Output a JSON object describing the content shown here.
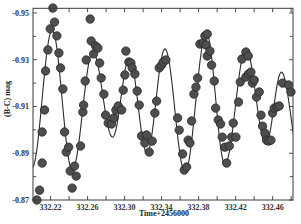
{
  "chart_data": {
    "type": "scatter",
    "title": "",
    "xlabel": "Time+2456000",
    "ylabel": "(B-C) mag",
    "xlim": [
      332.201,
      332.482
    ],
    "ylim": [
      -0.952,
      -0.87
    ],
    "y_inverted": true,
    "grid": false,
    "legend": null,
    "x_ticks": [
      {
        "value": 332.22,
        "label": "332.22"
      },
      {
        "value": 332.26,
        "label": "332.26"
      },
      {
        "value": 332.3,
        "label": "332.30"
      },
      {
        "value": 332.34,
        "label": "332.34"
      },
      {
        "value": 332.38,
        "label": "332.38"
      },
      {
        "value": 332.42,
        "label": "332.42"
      },
      {
        "value": 332.46,
        "label": "332.46"
      }
    ],
    "x_minor_ticks": [
      332.24,
      332.28,
      332.32,
      332.36,
      332.4,
      332.44,
      332.48
    ],
    "y_ticks": [
      {
        "value": -0.95,
        "label": "-0.95"
      },
      {
        "value": -0.93,
        "label": "-0.93"
      },
      {
        "value": -0.91,
        "label": "-0.91"
      },
      {
        "value": -0.89,
        "label": "-0.89"
      },
      {
        "value": -0.87,
        "label": "-0.87"
      }
    ],
    "y_minor_ticks": [
      -0.94,
      -0.92,
      -0.9,
      -0.88
    ],
    "series": [
      {
        "name": "observed",
        "kind": "scatter",
        "points": [
          [
            332.2052,
            -0.87
          ],
          [
            332.2081,
            -0.8742
          ],
          [
            332.2109,
            -0.8858
          ],
          [
            332.2109,
            -0.8991
          ],
          [
            332.2135,
            -0.9085
          ],
          [
            332.2146,
            -0.9252
          ],
          [
            332.2171,
            -0.9342
          ],
          [
            332.2196,
            -0.9432
          ],
          [
            332.2225,
            -0.9521
          ],
          [
            332.2243,
            -0.9461
          ],
          [
            332.2268,
            -0.9402
          ],
          [
            332.229,
            -0.9329
          ],
          [
            332.2308,
            -0.9265
          ],
          [
            332.2333,
            -0.9175
          ],
          [
            332.2351,
            -0.8991
          ],
          [
            332.2369,
            -0.8905
          ],
          [
            332.2395,
            -0.8926
          ],
          [
            332.2412,
            -0.8824
          ],
          [
            332.2433,
            -0.8751
          ],
          [
            332.2459,
            -0.8845
          ],
          [
            332.2477,
            -0.8802
          ],
          [
            332.2524,
            -0.8931
          ],
          [
            332.2549,
            -0.9076
          ],
          [
            332.2557,
            -0.9106
          ],
          [
            332.2574,
            -0.9209
          ],
          [
            332.2585,
            -0.9299
          ],
          [
            332.2628,
            -0.9474
          ],
          [
            332.2639,
            -0.938
          ],
          [
            332.2665,
            -0.9325
          ],
          [
            332.2686,
            -0.9359
          ],
          [
            332.2711,
            -0.935
          ],
          [
            332.273,
            -0.9286
          ],
          [
            332.2747,
            -0.9222
          ],
          [
            332.2776,
            -0.9153
          ],
          [
            332.2795,
            -0.9063
          ],
          [
            332.2823,
            -0.9029
          ],
          [
            332.2859,
            -0.9025
          ],
          [
            332.2884,
            -0.9051
          ],
          [
            332.2906,
            -0.9085
          ],
          [
            332.2931,
            -0.9102
          ],
          [
            332.2968,
            -0.9085
          ],
          [
            332.2985,
            -0.917
          ],
          [
            332.3003,
            -0.9235
          ],
          [
            332.3014,
            -0.9337
          ],
          [
            332.3046,
            -0.929
          ],
          [
            332.3068,
            -0.9286
          ],
          [
            332.3082,
            -0.9265
          ],
          [
            332.3111,
            -0.9239
          ],
          [
            332.3136,
            -0.9166
          ],
          [
            332.3158,
            -0.9106
          ],
          [
            332.3184,
            -0.8974
          ],
          [
            332.3219,
            -0.8944
          ],
          [
            332.3238,
            -0.8978
          ],
          [
            332.3266,
            -0.8905
          ],
          [
            332.3298,
            -0.8952
          ],
          [
            332.3327,
            -0.9072
          ],
          [
            332.3346,
            -0.9123
          ],
          [
            332.3374,
            -0.9265
          ],
          [
            332.34,
            -0.9277
          ],
          [
            332.3417,
            -0.929
          ],
          [
            332.3446,
            -0.9299
          ],
          [
            332.3573,
            -0.9051
          ],
          [
            332.359,
            -0.8999
          ],
          [
            332.3627,
            -0.8897
          ],
          [
            332.3644,
            -0.8828
          ],
          [
            332.367,
            -0.8841
          ],
          [
            332.3687,
            -0.8956
          ],
          [
            332.3706,
            -0.8944
          ],
          [
            332.3724,
            -0.9038
          ],
          [
            332.3749,
            -0.9153
          ],
          [
            332.3771,
            -0.9183
          ],
          [
            332.3789,
            -0.9222
          ],
          [
            332.3814,
            -0.9367
          ],
          [
            332.385,
            -0.9372
          ],
          [
            332.3868,
            -0.9402
          ],
          [
            332.3893,
            -0.941
          ],
          [
            332.3879,
            -0.9363
          ],
          [
            332.3893,
            -0.9316
          ],
          [
            332.3922,
            -0.9337
          ],
          [
            332.394,
            -0.9277
          ],
          [
            332.3969,
            -0.9209
          ],
          [
            332.3984,
            -0.9093
          ],
          [
            332.4012,
            -0.9042
          ],
          [
            332.4038,
            -0.9025
          ],
          [
            332.4055,
            -0.8969
          ],
          [
            332.4084,
            -0.8926
          ],
          [
            332.4103,
            -0.8858
          ],
          [
            332.4131,
            -0.8931
          ],
          [
            332.4157,
            -0.8969
          ],
          [
            332.4174,
            -0.9029
          ],
          [
            332.4203,
            -0.8969
          ],
          [
            332.4231,
            -0.9119
          ],
          [
            332.425,
            -0.9205
          ],
          [
            332.4268,
            -0.9303
          ],
          [
            332.4311,
            -0.9333
          ],
          [
            332.4336,
            -0.9316
          ],
          [
            332.4311,
            -0.9226
          ],
          [
            332.4339,
            -0.9239
          ],
          [
            332.4365,
            -0.9247
          ],
          [
            332.4382,
            -0.92
          ],
          [
            332.4401,
            -0.9213
          ],
          [
            332.4426,
            -0.914
          ],
          [
            332.4455,
            -0.9162
          ],
          [
            332.4474,
            -0.9063
          ],
          [
            332.4491,
            -0.9016
          ],
          [
            332.4517,
            -0.8986
          ],
          [
            332.4534,
            -0.8956
          ],
          [
            332.4556,
            -0.8952
          ],
          [
            332.4581,
            -0.8956
          ],
          [
            332.4599,
            -0.9072
          ],
          [
            332.4617,
            -0.9093
          ],
          [
            332.4646,
            -0.9098
          ],
          [
            332.4671,
            -0.9102
          ],
          [
            332.4707,
            -0.92
          ],
          [
            332.4772,
            -0.9192
          ],
          [
            332.4798,
            -0.9162
          ]
        ]
      },
      {
        "name": "model fit",
        "kind": "line",
        "extrema": [
          [
            332.2,
            -0.8837
          ],
          [
            332.2217,
            -0.9427
          ],
          [
            332.2434,
            -0.8828
          ],
          [
            332.2657,
            -0.9333
          ],
          [
            332.287,
            -0.8969
          ],
          [
            332.3052,
            -0.9307
          ],
          [
            332.3241,
            -0.8901
          ],
          [
            332.3436,
            -0.9346
          ],
          [
            332.3652,
            -0.8819
          ],
          [
            332.3884,
            -0.9414
          ],
          [
            332.4084,
            -0.8854
          ],
          [
            332.4311,
            -0.9346
          ],
          [
            332.4527,
            -0.8939
          ],
          [
            332.4695,
            -0.9247
          ],
          [
            332.4895,
            -0.888
          ]
        ]
      }
    ]
  }
}
